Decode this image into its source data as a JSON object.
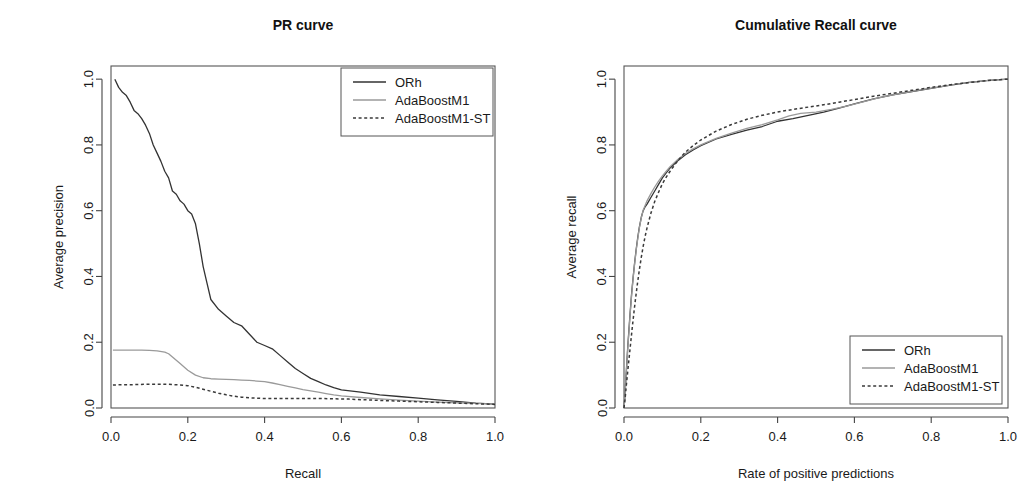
{
  "figure": {
    "background": "#ffffff",
    "panels": [
      "pr",
      "cr"
    ]
  },
  "series_styles": {
    "ORh": {
      "color": "#333333",
      "dash": "none",
      "width": 1.3
    },
    "AdaBoostM1": {
      "color": "#9a9a9a",
      "dash": "none",
      "width": 1.3
    },
    "AdaBoostM1-ST": {
      "color": "#3a3a3a",
      "dash": "3,2.6",
      "width": 1.5
    }
  },
  "legend": {
    "entries": [
      {
        "label": "ORh",
        "style": "ORh"
      },
      {
        "label": "AdaBoostM1",
        "style": "AdaBoostM1"
      },
      {
        "label": "AdaBoostM1-ST",
        "style": "AdaBoostM1-ST"
      }
    ]
  },
  "chart_data": [
    {
      "id": "pr",
      "type": "line",
      "title": "PR curve",
      "xlabel": "Recall",
      "ylabel": "Average precision",
      "xlim": [
        0.0,
        1.0
      ],
      "ylim": [
        0.0,
        1.04
      ],
      "xticks": [
        0.0,
        0.2,
        0.4,
        0.6,
        0.8,
        1.0
      ],
      "xticklabels": [
        "0.0",
        "0.2",
        "0.4",
        "0.6",
        "0.8",
        "1.0"
      ],
      "yticks": [
        0.0,
        0.2,
        0.4,
        0.6,
        0.8,
        1.0
      ],
      "yticklabels": [
        "0.0",
        "0.2",
        "0.4",
        "0.6",
        "0.8",
        "1.0"
      ],
      "grid": false,
      "legend_position": "top-right",
      "series": [
        {
          "name": "ORh",
          "x": [
            0.01,
            0.02,
            0.03,
            0.04,
            0.05,
            0.06,
            0.07,
            0.08,
            0.09,
            0.1,
            0.11,
            0.12,
            0.13,
            0.14,
            0.15,
            0.16,
            0.17,
            0.18,
            0.19,
            0.2,
            0.21,
            0.22,
            0.23,
            0.24,
            0.25,
            0.26,
            0.28,
            0.3,
            0.32,
            0.34,
            0.36,
            0.38,
            0.4,
            0.42,
            0.44,
            0.46,
            0.48,
            0.5,
            0.52,
            0.54,
            0.56,
            0.58,
            0.6,
            0.65,
            0.7,
            0.75,
            0.8,
            0.85,
            0.9,
            0.95,
            1.0
          ],
          "y": [
            1.0,
            0.975,
            0.96,
            0.95,
            0.93,
            0.905,
            0.895,
            0.88,
            0.86,
            0.835,
            0.8,
            0.775,
            0.75,
            0.72,
            0.7,
            0.66,
            0.65,
            0.63,
            0.62,
            0.6,
            0.59,
            0.56,
            0.5,
            0.43,
            0.38,
            0.33,
            0.3,
            0.28,
            0.26,
            0.25,
            0.225,
            0.2,
            0.19,
            0.18,
            0.16,
            0.14,
            0.12,
            0.105,
            0.09,
            0.08,
            0.07,
            0.062,
            0.055,
            0.048,
            0.04,
            0.035,
            0.03,
            0.025,
            0.02,
            0.015,
            0.012
          ]
        },
        {
          "name": "AdaBoostM1",
          "x": [
            0.005,
            0.02,
            0.04,
            0.06,
            0.08,
            0.1,
            0.12,
            0.14,
            0.15,
            0.16,
            0.18,
            0.2,
            0.22,
            0.24,
            0.26,
            0.28,
            0.3,
            0.32,
            0.34,
            0.36,
            0.38,
            0.4,
            0.42,
            0.44,
            0.46,
            0.48,
            0.5,
            0.52,
            0.54,
            0.56,
            0.58,
            0.6,
            0.65,
            0.7,
            0.75,
            0.8,
            0.85,
            0.9,
            0.95,
            1.0
          ],
          "y": [
            0.176,
            0.176,
            0.176,
            0.176,
            0.176,
            0.175,
            0.174,
            0.17,
            0.165,
            0.155,
            0.135,
            0.115,
            0.1,
            0.092,
            0.089,
            0.088,
            0.087,
            0.086,
            0.085,
            0.084,
            0.082,
            0.08,
            0.076,
            0.071,
            0.066,
            0.061,
            0.056,
            0.052,
            0.048,
            0.044,
            0.04,
            0.037,
            0.032,
            0.028,
            0.024,
            0.021,
            0.018,
            0.016,
            0.014,
            0.012
          ]
        },
        {
          "name": "AdaBoostM1-ST",
          "x": [
            0.005,
            0.03,
            0.06,
            0.09,
            0.12,
            0.15,
            0.18,
            0.2,
            0.22,
            0.25,
            0.28,
            0.3,
            0.32,
            0.34,
            0.36,
            0.38,
            0.4,
            0.43,
            0.46,
            0.5,
            0.54,
            0.58,
            0.62,
            0.66,
            0.7,
            0.75,
            0.8,
            0.85,
            0.9,
            0.95,
            1.0
          ],
          "y": [
            0.07,
            0.071,
            0.071,
            0.072,
            0.072,
            0.072,
            0.07,
            0.068,
            0.063,
            0.054,
            0.045,
            0.04,
            0.036,
            0.033,
            0.031,
            0.03,
            0.029,
            0.029,
            0.029,
            0.029,
            0.029,
            0.028,
            0.027,
            0.025,
            0.023,
            0.021,
            0.019,
            0.017,
            0.015,
            0.013,
            0.011
          ]
        }
      ]
    },
    {
      "id": "cr",
      "type": "line",
      "title": "Cumulative Recall curve",
      "xlabel": "Rate of positive predictions",
      "ylabel": "Average recall",
      "xlim": [
        0.0,
        1.0
      ],
      "ylim": [
        0.0,
        1.04
      ],
      "xticks": [
        0.0,
        0.2,
        0.4,
        0.6,
        0.8,
        1.0
      ],
      "xticklabels": [
        "0.0",
        "0.2",
        "0.4",
        "0.6",
        "0.8",
        "1.0"
      ],
      "yticks": [
        0.0,
        0.2,
        0.4,
        0.6,
        0.8,
        1.0
      ],
      "yticklabels": [
        "0.0",
        "0.2",
        "0.4",
        "0.6",
        "0.8",
        "1.0"
      ],
      "grid": false,
      "legend_position": "bottom-right",
      "series": [
        {
          "name": "ORh",
          "x": [
            0.0,
            0.002,
            0.004,
            0.006,
            0.008,
            0.01,
            0.013,
            0.016,
            0.02,
            0.024,
            0.028,
            0.032,
            0.036,
            0.04,
            0.045,
            0.05,
            0.055,
            0.06,
            0.07,
            0.08,
            0.09,
            0.1,
            0.11,
            0.12,
            0.14,
            0.16,
            0.18,
            0.2,
            0.24,
            0.28,
            0.32,
            0.36,
            0.4,
            0.44,
            0.48,
            0.52,
            0.56,
            0.6,
            0.65,
            0.7,
            0.75,
            0.8,
            0.85,
            0.9,
            0.95,
            1.0
          ],
          "y": [
            0.0,
            0.03,
            0.07,
            0.11,
            0.15,
            0.19,
            0.24,
            0.29,
            0.35,
            0.4,
            0.445,
            0.485,
            0.52,
            0.55,
            0.58,
            0.6,
            0.612,
            0.62,
            0.64,
            0.66,
            0.68,
            0.7,
            0.715,
            0.73,
            0.752,
            0.77,
            0.785,
            0.798,
            0.818,
            0.832,
            0.845,
            0.856,
            0.872,
            0.88,
            0.89,
            0.9,
            0.912,
            0.925,
            0.94,
            0.952,
            0.962,
            0.972,
            0.982,
            0.99,
            0.996,
            1.0
          ]
        },
        {
          "name": "AdaBoostM1",
          "x": [
            0.0,
            0.002,
            0.004,
            0.006,
            0.008,
            0.01,
            0.013,
            0.016,
            0.02,
            0.024,
            0.028,
            0.032,
            0.036,
            0.04,
            0.045,
            0.05,
            0.055,
            0.06,
            0.07,
            0.08,
            0.09,
            0.1,
            0.11,
            0.12,
            0.14,
            0.16,
            0.18,
            0.2,
            0.24,
            0.28,
            0.32,
            0.36,
            0.4,
            0.43,
            0.46,
            0.5,
            0.54,
            0.58,
            0.62,
            0.66,
            0.7,
            0.75,
            0.8,
            0.85,
            0.9,
            0.95,
            1.0
          ],
          "y": [
            0.0,
            0.028,
            0.066,
            0.105,
            0.145,
            0.185,
            0.235,
            0.285,
            0.345,
            0.398,
            0.442,
            0.482,
            0.516,
            0.548,
            0.578,
            0.602,
            0.616,
            0.63,
            0.652,
            0.672,
            0.69,
            0.706,
            0.72,
            0.734,
            0.756,
            0.774,
            0.788,
            0.8,
            0.82,
            0.836,
            0.85,
            0.862,
            0.876,
            0.888,
            0.896,
            0.9,
            0.908,
            0.918,
            0.93,
            0.942,
            0.952,
            0.963,
            0.973,
            0.982,
            0.99,
            0.996,
            1.0
          ]
        },
        {
          "name": "AdaBoostM1-ST",
          "x": [
            0.0,
            0.003,
            0.006,
            0.01,
            0.014,
            0.018,
            0.022,
            0.026,
            0.03,
            0.035,
            0.04,
            0.045,
            0.05,
            0.055,
            0.06,
            0.07,
            0.08,
            0.09,
            0.1,
            0.11,
            0.12,
            0.14,
            0.16,
            0.18,
            0.2,
            0.24,
            0.28,
            0.32,
            0.36,
            0.4,
            0.44,
            0.48,
            0.52,
            0.56,
            0.6,
            0.65,
            0.7,
            0.75,
            0.8,
            0.85,
            0.9,
            0.95,
            1.0
          ],
          "y": [
            0.0,
            0.03,
            0.068,
            0.115,
            0.16,
            0.205,
            0.25,
            0.292,
            0.332,
            0.378,
            0.42,
            0.458,
            0.492,
            0.522,
            0.548,
            0.592,
            0.628,
            0.656,
            0.682,
            0.702,
            0.72,
            0.752,
            0.778,
            0.798,
            0.815,
            0.842,
            0.862,
            0.878,
            0.89,
            0.9,
            0.908,
            0.915,
            0.922,
            0.93,
            0.938,
            0.948,
            0.957,
            0.966,
            0.975,
            0.983,
            0.99,
            0.996,
            1.0
          ]
        }
      ]
    }
  ]
}
